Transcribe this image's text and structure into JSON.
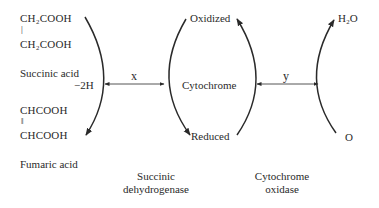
{
  "diagram": {
    "type": "coupled redox reactions",
    "colors": {
      "line": "#2a2a2a",
      "text": "#2a2a2a",
      "background": "#ffffff"
    },
    "left_cycle": {
      "succinic_acid": {
        "line1": "CH₂COOH",
        "bond": "|",
        "line2": "CH₂COOH",
        "label": "Succinic acid"
      },
      "fumaric_acid": {
        "line1": "CHCOOH",
        "bond": "‖",
        "line2": "CHCOOH",
        "label": "Fumaric acid"
      },
      "removed_hydrogen": "−2H",
      "enzyme": {
        "line1": "Succinic",
        "line2": "dehydrogenase"
      }
    },
    "middle_cycle": {
      "top": "Oxidized",
      "center": "Cytochrome",
      "bottom": "Reduced"
    },
    "right_cycle": {
      "top": "H₂O",
      "bottom": "O",
      "enzyme": {
        "line1": "Cytochrome",
        "line2": "oxidase"
      }
    },
    "connectors": {
      "left_to_middle": "x",
      "middle_to_right": "y"
    }
  }
}
